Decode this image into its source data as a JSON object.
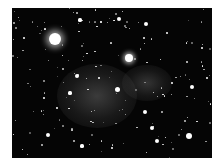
{
  "image": {
    "description": "Astronomical photograph of a star field with a diffuse grey nebulous region (galaxy cluster) near center",
    "background_color": "#050505",
    "border_color": "#ffffff",
    "bright_stars": [
      {
        "x": 43,
        "y": 31,
        "r": 6
      },
      {
        "x": 117,
        "y": 50,
        "r": 4
      },
      {
        "x": 105,
        "y": 81,
        "r": 2.5
      },
      {
        "x": 177,
        "y": 128,
        "r": 3
      },
      {
        "x": 65,
        "y": 68,
        "r": 2
      },
      {
        "x": 180,
        "y": 79,
        "r": 2
      },
      {
        "x": 133,
        "y": 104,
        "r": 2
      },
      {
        "x": 140,
        "y": 120,
        "r": 2
      },
      {
        "x": 36,
        "y": 127,
        "r": 2
      },
      {
        "x": 134,
        "y": 16,
        "r": 2
      },
      {
        "x": 107,
        "y": 11,
        "r": 2
      },
      {
        "x": 68,
        "y": 12,
        "r": 1.6
      },
      {
        "x": 145,
        "y": 133,
        "r": 2
      },
      {
        "x": 70,
        "y": 138,
        "r": 1.6
      },
      {
        "x": 58,
        "y": 85,
        "r": 1.6
      },
      {
        "x": 32,
        "y": 90,
        "r": 1.2
      },
      {
        "x": 195,
        "y": 70,
        "r": 1.2
      },
      {
        "x": 160,
        "y": 75,
        "r": 1.4
      },
      {
        "x": 45,
        "y": 100,
        "r": 1.2
      },
      {
        "x": 12,
        "y": 30,
        "r": 1.2
      },
      {
        "x": 100,
        "y": 140,
        "r": 1.4
      },
      {
        "x": 155,
        "y": 25,
        "r": 1.2
      },
      {
        "x": 190,
        "y": 40,
        "r": 1
      }
    ],
    "nebulae": [
      {
        "x": 85,
        "y": 88,
        "rx": 40,
        "ry": 32,
        "opacity": 0.35
      },
      {
        "x": 135,
        "y": 75,
        "rx": 25,
        "ry": 18,
        "opacity": 0.3
      }
    ]
  }
}
